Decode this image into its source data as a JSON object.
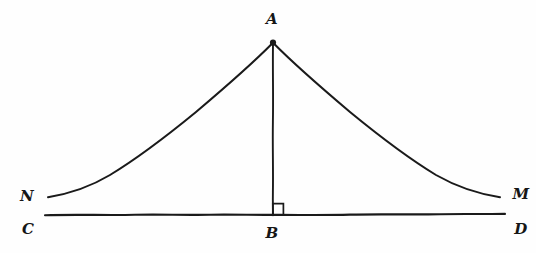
{
  "figure": {
    "kind": "hand-drawn-geometry-diagram",
    "title": "",
    "background_color": "#fefefe",
    "ink_color": "#1a1a1a",
    "canvas": {
      "width": 536,
      "height": 253
    },
    "points": [
      {
        "id": "A",
        "label": "A",
        "x": 273,
        "y": 42,
        "label_x": 272,
        "label_y": 19,
        "role": "apex"
      },
      {
        "id": "B",
        "label": "B",
        "x": 273,
        "y": 215,
        "label_x": 272,
        "label_y": 233,
        "role": "foot-of-perpendicular"
      },
      {
        "id": "C",
        "label": "C",
        "x": 45,
        "y": 215,
        "label_x": 28,
        "label_y": 229,
        "role": "baseline-left-end"
      },
      {
        "id": "D",
        "label": "D",
        "x": 505,
        "y": 214,
        "label_x": 521,
        "label_y": 229,
        "role": "baseline-right-end"
      },
      {
        "id": "N",
        "label": "N",
        "x": 48,
        "y": 197,
        "label_x": 27,
        "label_y": 196,
        "role": "curve-left-end"
      },
      {
        "id": "M",
        "label": "M",
        "x": 500,
        "y": 197,
        "label_x": 521,
        "label_y": 194,
        "role": "curve-right-end"
      }
    ],
    "segments": [
      {
        "id": "AB",
        "from": "A",
        "to": "B",
        "kind": "straight",
        "style": "solid"
      },
      {
        "id": "CD",
        "from": "C",
        "to": "D",
        "kind": "straight",
        "style": "solid",
        "note": "baseline"
      }
    ],
    "curves": [
      {
        "id": "AN",
        "from": "A",
        "to": "N",
        "kind": "curve",
        "concavity": "up",
        "style": "solid"
      },
      {
        "id": "AM",
        "from": "A",
        "to": "M",
        "kind": "curve",
        "concavity": "up",
        "style": "solid"
      }
    ],
    "markers": [
      {
        "id": "right-angle-B",
        "at": "B",
        "kind": "right-angle-square",
        "size": 10,
        "opens": "up-right"
      },
      {
        "id": "vertex-dot-A",
        "at": "A",
        "kind": "ink-dot",
        "size": 4
      }
    ]
  }
}
